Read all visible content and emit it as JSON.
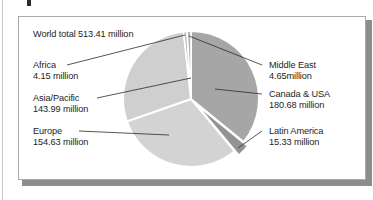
{
  "figure": {
    "world_total_label": "World total 513.41 million",
    "frame_border_color": "#a9a9a9",
    "shadow_color": "#8d8d8d",
    "background": "#ffffff",
    "text_color": "#1d1d1d"
  },
  "labels": {
    "africa": {
      "name": "Africa",
      "value": "4.15 million"
    },
    "asia_pacific": {
      "name": "Asia/Pacific",
      "value": "143.99 million"
    },
    "europe": {
      "name": "Europe",
      "value": "154.63 million"
    },
    "middle_east": {
      "name": "Middle East",
      "value": "4.65million"
    },
    "canada_usa": {
      "name": "Canada & USA",
      "value": "180.68 million"
    },
    "latin_america": {
      "name": "Latin America",
      "value": "15.33 million"
    }
  },
  "chart_data": {
    "type": "pie",
    "title": "World total 513.41 million",
    "unit": "million internet users",
    "total": 513.41,
    "legend": "labels-with-leader-lines",
    "grid": false,
    "start_angle_deg": 0,
    "direction": "clockwise",
    "exploded_slices": [
      "Latin America"
    ],
    "categories": [
      "Canada & USA",
      "Latin America",
      "Europe",
      "Asia/Pacific",
      "Africa",
      "Middle East"
    ],
    "values": [
      180.68,
      15.33,
      154.63,
      143.99,
      4.15,
      4.65
    ],
    "percentages": [
      35.2,
      3.0,
      30.1,
      28.0,
      0.8,
      0.9
    ],
    "colors": [
      "#a6a6a6",
      "#939393",
      "#d3d3d3",
      "#cfcfcf",
      "#bdbdbd",
      "#b4b4b4"
    ],
    "slices": [
      {
        "label": "Canada & USA",
        "value": 180.68,
        "percent": 35.2,
        "color": "#a6a6a6",
        "exploded": false
      },
      {
        "label": "Latin America",
        "value": 15.33,
        "percent": 3.0,
        "color": "#939393",
        "exploded": true
      },
      {
        "label": "Europe",
        "value": 154.63,
        "percent": 30.1,
        "color": "#d3d3d3",
        "exploded": false
      },
      {
        "label": "Asia/Pacific",
        "value": 143.99,
        "percent": 28.0,
        "color": "#cfcfcf",
        "exploded": false
      },
      {
        "label": "Africa",
        "value": 4.15,
        "percent": 0.8,
        "color": "#bdbdbd",
        "exploded": false
      },
      {
        "label": "Middle East",
        "value": 4.65,
        "percent": 0.9,
        "color": "#b4b4b4",
        "exploded": false
      }
    ]
  }
}
